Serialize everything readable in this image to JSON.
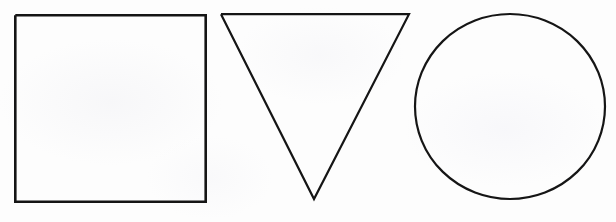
{
  "figure": {
    "background_color": "#fdfdfd",
    "stroke_color": "#151515",
    "width": 616,
    "height": 222
  },
  "shapes": [
    {
      "name": "square",
      "label": "Square",
      "stroke_width": 2.6,
      "geometry": {
        "left": 14,
        "top": 14,
        "right": 207,
        "bottom": 203,
        "width": 193,
        "height": 189
      },
      "points": "15.3,15.3 205.7,15.3 205.7,201.7 15.3,201.7 15.3,15.3"
    },
    {
      "name": "triangle-inverted",
      "label": "Inverted Triangle",
      "stroke_width": 2.2,
      "geometry": {
        "apex_bottom_x": 314,
        "apex_bottom_y": 200,
        "top_left_x": 220,
        "top_left_y": 13,
        "top_right_x": 410,
        "top_right_y": 13,
        "width": 190,
        "height": 187
      },
      "points": "221,14.2 409,14.2 314,199 221,14.2"
    },
    {
      "name": "circle",
      "label": "Circle",
      "stroke_width": 2.2,
      "geometry": {
        "center_x": 510,
        "center_y": 106.5,
        "radius_x": 95,
        "radius_y": 92.5,
        "left": 415,
        "top": 14,
        "right": 605,
        "bottom": 199
      }
    }
  ]
}
